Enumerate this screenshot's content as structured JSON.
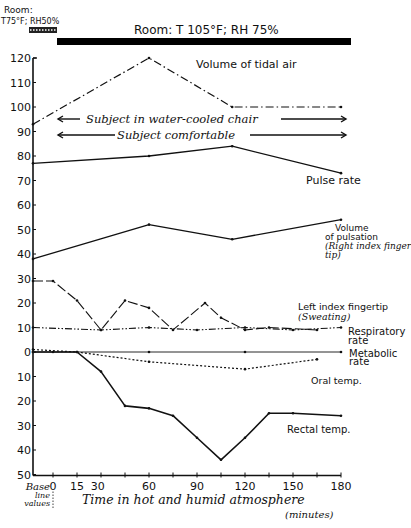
{
  "chart_data": {
    "type": "line",
    "title": "",
    "xlabel": "Time in hot and humid atmosphere",
    "xlabel_unit": "(minutes)",
    "x_base_label": [
      "Base",
      "line",
      "values"
    ],
    "x_ticks": [
      0,
      15,
      30,
      60,
      90,
      120,
      150,
      180
    ],
    "x_tick_labels": [
      "0",
      "15",
      "30",
      "60",
      "90",
      "120",
      "150",
      "180"
    ],
    "x_minor_step": 15,
    "xlim": [
      0,
      180
    ],
    "y_tick_values": [
      120,
      110,
      100,
      90,
      80,
      70,
      60,
      50,
      40,
      30,
      20,
      10,
      0,
      -10,
      -20,
      -30,
      -40,
      -50
    ],
    "y_tick_labels": [
      "120",
      "110",
      "100",
      "90",
      "80",
      "70",
      "60",
      "50",
      "40",
      "30",
      "20",
      "10",
      "0",
      "10",
      "20",
      "30",
      "40",
      "50"
    ],
    "ylim": [
      -50,
      120
    ],
    "grid": false,
    "conditions": {
      "baseline_room": [
        "Room:",
        "T75°F; RH50%"
      ],
      "exposure_room": "Room: T 105°F; RH 75%"
    },
    "annotations": {
      "water_cooled": "Subject in water-cooled chair",
      "comfortable": "Subject comfortable"
    },
    "series": [
      {
        "name": "Volume of tidal air",
        "style": "dashdot",
        "points": [
          [
            "base",
            93
          ],
          [
            60,
            120
          ],
          [
            112,
            100
          ],
          [
            180,
            100
          ]
        ],
        "label_lines": [
          "Volume of tidal air"
        ]
      },
      {
        "name": "Pulse rate",
        "style": "solid",
        "points": [
          [
            "base",
            77
          ],
          [
            60,
            80
          ],
          [
            112,
            84
          ],
          [
            180,
            73
          ]
        ],
        "label_lines": [
          "Pulse rate"
        ]
      },
      {
        "name": "Volume of pulsation (Right index finger tip)",
        "style": "solid",
        "points": [
          [
            "base",
            38
          ],
          [
            60,
            52
          ],
          [
            112,
            46
          ],
          [
            180,
            54
          ]
        ],
        "label_lines": [
          "Volume",
          "of pulsation",
          "(Right index finger",
          "tip)"
        ]
      },
      {
        "name": "Left index fingertip (Sweating)",
        "style": "longdash",
        "points": [
          [
            "base",
            29
          ],
          [
            0,
            29
          ],
          [
            15,
            21
          ],
          [
            30,
            9
          ],
          [
            45,
            21
          ],
          [
            60,
            18
          ],
          [
            75,
            9
          ],
          [
            95,
            20
          ],
          [
            105,
            14
          ],
          [
            120,
            9
          ],
          [
            135,
            10
          ],
          [
            165,
            9
          ]
        ],
        "label_lines": [
          "Left index fingertip",
          "(Sweating)"
        ]
      },
      {
        "name": "Respiratory rate",
        "style": "dashdotdot",
        "points": [
          [
            "base",
            10
          ],
          [
            30,
            9
          ],
          [
            60,
            10
          ],
          [
            90,
            9
          ],
          [
            120,
            10
          ],
          [
            150,
            9
          ],
          [
            180,
            10
          ]
        ],
        "label_lines": [
          "Respiratory",
          "rate"
        ]
      },
      {
        "name": "Metabolic rate",
        "style": "solid-thin",
        "points": [
          [
            "base",
            0
          ],
          [
            0,
            0
          ],
          [
            60,
            0
          ],
          [
            120,
            0
          ],
          [
            180,
            0
          ]
        ],
        "label_lines": [
          "Metabolic",
          "rate"
        ]
      },
      {
        "name": "Oral temp.",
        "style": "dotted",
        "points": [
          [
            "base",
            1
          ],
          [
            15,
            0
          ],
          [
            60,
            -4
          ],
          [
            120,
            -7
          ],
          [
            165,
            -3
          ]
        ],
        "label_lines": [
          "Oral temp."
        ]
      },
      {
        "name": "Rectal temp.",
        "style": "solid-ticked",
        "points": [
          [
            "base",
            0
          ],
          [
            15,
            0
          ],
          [
            30,
            -8
          ],
          [
            45,
            -22
          ],
          [
            60,
            -23
          ],
          [
            75,
            -26
          ],
          [
            90,
            -35
          ],
          [
            105,
            -44
          ],
          [
            120,
            -35
          ],
          [
            135,
            -25
          ],
          [
            150,
            -25
          ],
          [
            180,
            -26
          ]
        ],
        "label_lines": [
          "Rectal temp."
        ]
      }
    ]
  }
}
